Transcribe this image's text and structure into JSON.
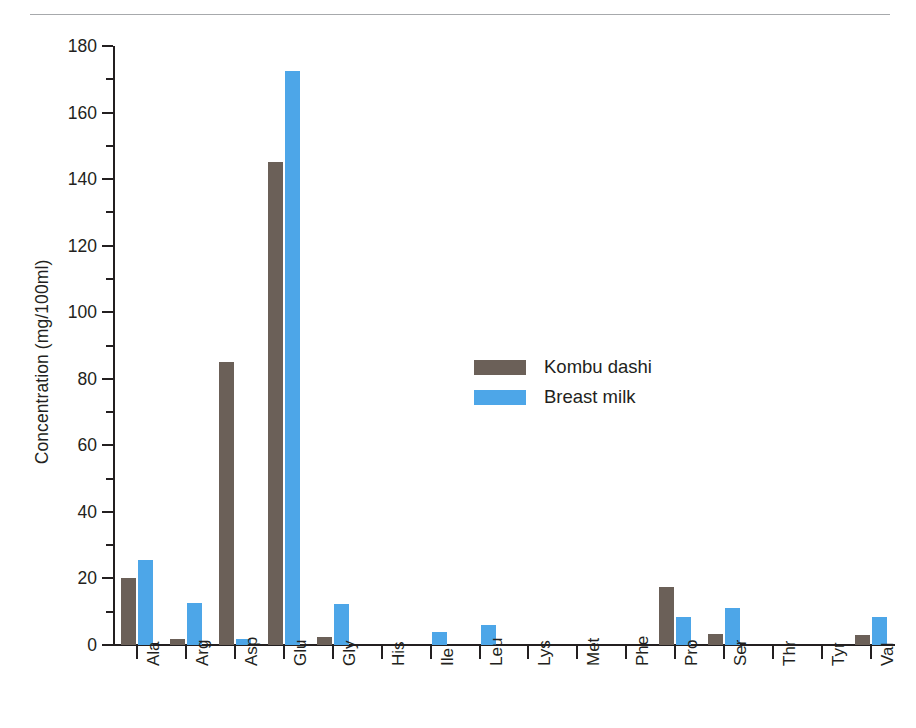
{
  "figure": {
    "top_rule": true
  },
  "legend": {
    "position": "inside-center",
    "entries": [
      {
        "label": "Kombu dashi",
        "color": "#6b6058"
      },
      {
        "label": "Breast milk",
        "color": "#4da6e8"
      }
    ]
  },
  "chart_data": {
    "type": "bar",
    "title": "",
    "xlabel": "",
    "ylabel": "Concentration (mg/100ml)",
    "ylim": [
      0,
      180
    ],
    "ytick_step": 20,
    "yminor_step": 10,
    "yticks": [
      0,
      20,
      40,
      60,
      80,
      100,
      120,
      140,
      160,
      180
    ],
    "ytick_labels": [
      "0",
      "20",
      "40",
      "60",
      "80",
      "100",
      "120",
      "140",
      "160",
      "180"
    ],
    "grid": false,
    "legend_position": "inside-center",
    "categories": [
      "Ala",
      "Arg",
      "Asp",
      "Glu",
      "Gly",
      "His",
      "Ile",
      "Leu",
      "Lys",
      "Met",
      "Phe",
      "Pro",
      "Ser",
      "Thr",
      "Tyr",
      "Val"
    ],
    "series": [
      {
        "name": "Kombu dashi",
        "color": "#6b6058",
        "values": [
          20,
          1.8,
          85,
          145,
          2.4,
          0,
          0,
          0,
          0,
          0,
          0,
          17.5,
          3.4,
          0,
          0,
          3
        ]
      },
      {
        "name": "Breast milk",
        "color": "#4da6e8",
        "values": [
          25.4,
          12.6,
          1.7,
          172.5,
          12.4,
          0,
          3.9,
          6.1,
          0,
          0,
          0,
          8.4,
          11.2,
          0,
          0,
          8.5
        ]
      }
    ]
  }
}
